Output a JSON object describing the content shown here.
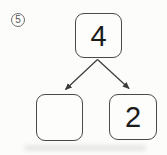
{
  "worksheet": {
    "problem_number": "5",
    "number_bond": {
      "whole": "4",
      "parts": [
        "",
        "2"
      ]
    }
  },
  "style": {
    "line_color": "#3a3a3a",
    "box_border_color": "#4a4a4a",
    "text_color": "#1c1c1c",
    "background_color": "#fcfcfb"
  }
}
